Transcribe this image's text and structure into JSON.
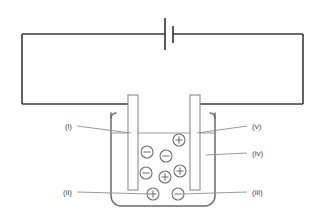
{
  "diagram": {
    "colors": {
      "wire": "#3a3a3a",
      "beaker": "#6b6b6b",
      "electrode_stroke": "#8a8a8a",
      "ion_stroke": "#6f6f6f",
      "leader": "#8e8e8e",
      "label_text": "#4a4a4a",
      "background": "#ffffff"
    },
    "labels": [
      {
        "id": "i",
        "text": "(i)",
        "side": "left",
        "x": 72,
        "y": 128,
        "target_x": 131,
        "target_y": 133,
        "meaning": "left-electrode"
      },
      {
        "id": "ii",
        "text": "(ii)",
        "side": "left",
        "x": 72,
        "y": 194,
        "target_x": 150,
        "target_y": 194,
        "meaning": "positive-ion"
      },
      {
        "id": "iii",
        "text": "(iii)",
        "side": "right",
        "x": 252,
        "y": 194,
        "target_x": 182,
        "target_y": 194,
        "meaning": "negative-ion"
      },
      {
        "id": "iv",
        "text": "(iv)",
        "side": "right",
        "x": 252,
        "y": 155,
        "target_x": 206,
        "target_y": 155,
        "meaning": "electrolyte-solution"
      },
      {
        "id": "v",
        "text": "(v)",
        "side": "right",
        "x": 252,
        "y": 128,
        "target_x": 197,
        "target_y": 133,
        "meaning": "right-electrode"
      }
    ],
    "ions": [
      {
        "charge": "+",
        "x": 179,
        "y": 140
      },
      {
        "charge": "-",
        "x": 147,
        "y": 152
      },
      {
        "charge": "-",
        "x": 166,
        "y": 156
      },
      {
        "charge": "-",
        "x": 146,
        "y": 173
      },
      {
        "charge": "+",
        "x": 180,
        "y": 171
      },
      {
        "charge": "+",
        "x": 165,
        "y": 177
      },
      {
        "charge": "+",
        "x": 153,
        "y": 194
      },
      {
        "charge": "-",
        "x": 178,
        "y": 194
      }
    ],
    "ion_radius": 6,
    "circuit": {
      "left_x": 22,
      "right_x": 303,
      "top_y": 34,
      "bottom_y": 104,
      "battery": {
        "center_x": 168,
        "long_plate_x": 165,
        "long_plate_y1": 18,
        "long_plate_y2": 50,
        "short_plate_x": 173,
        "short_plate_y1": 26,
        "short_plate_y2": 43
      }
    },
    "beaker": {
      "left_x": 111,
      "right_x": 215,
      "top_y": 113,
      "bottom_y": 206,
      "corner_radius": 10,
      "liquid_level_y": 133
    },
    "electrodes": [
      {
        "name": "left-electrode",
        "x": 128,
        "y": 95,
        "width": 10,
        "height": 95
      },
      {
        "name": "right-electrode",
        "x": 190,
        "y": 95,
        "width": 10,
        "height": 95
      }
    ]
  }
}
